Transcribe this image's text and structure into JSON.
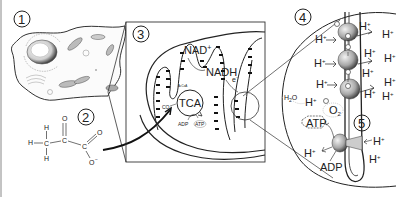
{
  "figure": {
    "panels": [
      {
        "id": "1",
        "label": "1",
        "subject": "animal cell"
      },
      {
        "id": "2",
        "label": "2",
        "subject": "pyruvate molecule"
      },
      {
        "id": "3",
        "label": "3",
        "subject": "mitochondrion"
      },
      {
        "id": "4",
        "label": "4",
        "subject": "electron transport chain"
      },
      {
        "id": "5",
        "label": "5",
        "subject": "ATP synthase"
      }
    ]
  },
  "pyruvate": {
    "h1": "H",
    "h2": "H",
    "h3": "H",
    "c1": "C",
    "c2": "C",
    "c3": "C",
    "o_double1": "O",
    "o_double2": "O",
    "o_minus": "O",
    "charge": "−"
  },
  "mitochondrion": {
    "nad_plus": "NAD",
    "nad_plus_sup": "+",
    "nadh": "NADH",
    "electron": "e",
    "electron_sup": "−",
    "co2": "CO",
    "co2_sub": "2",
    "tca": "TCA",
    "adp": "ADP",
    "atp": "ATP",
    "acetyl": "AcCoA"
  },
  "etc": {
    "h_plus": "H",
    "h_sup": "+",
    "h2o": "H",
    "h2o_sub": "2",
    "h2o_o": "O",
    "o2": "O",
    "o2_sub": "2",
    "electron_marker": "e",
    "atp": "ATP",
    "adp": "ADP"
  },
  "colors": {
    "ink": "#222222",
    "light_ink": "#777777",
    "protein_fill": "#bdbdbd",
    "frame": "#333333"
  }
}
